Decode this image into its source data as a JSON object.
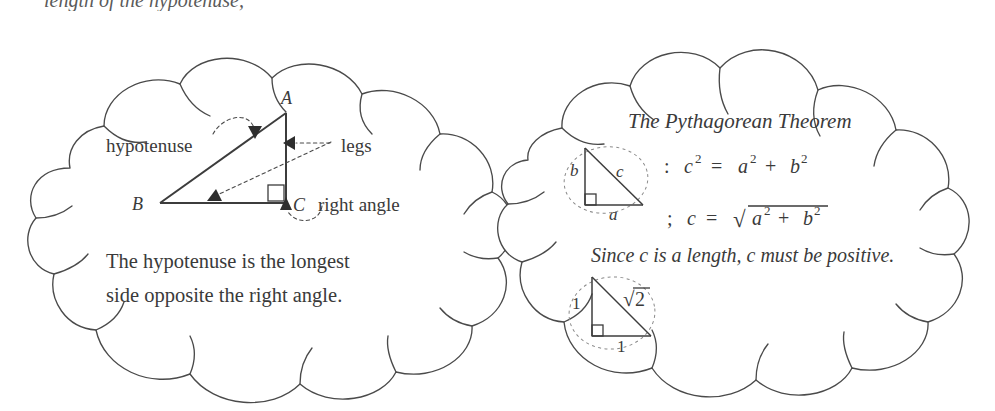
{
  "page": {
    "width": 995,
    "height": 411,
    "background": "#ffffff",
    "ink_color": "#3a3a3a",
    "outline_color": "#4a4a4a",
    "dash_color": "#8a8a8a"
  },
  "clipped_top_text": "length of the hypotenuse,",
  "left_cloud": {
    "name": "hypotenuse-cloud",
    "labels": {
      "hypotenuse": "hypotenuse",
      "legs": "legs",
      "right_angle": "right angle"
    },
    "triangle": {
      "vertices": [
        "A",
        "B",
        "C"
      ],
      "vertex_A": "A",
      "vertex_B": "B",
      "vertex_C": "C"
    },
    "caption_line1": "The hypotenuse is the longest",
    "caption_line2": "side opposite the right angle."
  },
  "right_cloud": {
    "name": "pythagorean-theorem-cloud",
    "title": "The Pythagorean Theorem",
    "triangle_labels": {
      "leg_vertical": "b",
      "hypotenuse": "c",
      "leg_horizontal": "a"
    },
    "formula1": {
      "prefix": ":",
      "lhs_base": "c",
      "lhs_exp": "2",
      "eq": "=",
      "t1_base": "a",
      "t1_exp": "2",
      "plus": "+",
      "t2_base": "b",
      "t2_exp": "2",
      "plain": ": c² = a² + b²"
    },
    "formula2": {
      "prefix": ";",
      "lhs": "c",
      "eq": "=",
      "radical": "√",
      "r1_base": "a",
      "r1_exp": "2",
      "plus": "+",
      "r2_base": "b",
      "r2_exp": "2",
      "plain": "; c = √(a² + b²)"
    },
    "note": "Since c is a length,  c must be positive.",
    "example_triangle_labels": {
      "leg_vertical": "1",
      "hypotenuse_radical": "√",
      "hypotenuse_value": "2",
      "leg_horizontal": "1"
    }
  },
  "icons": {
    "arrowhead": "triangle-arrowhead-icon",
    "right_angle_marker": "right-angle-square-icon",
    "dashed_ellipse": "dashed-ellipse-highlight-icon"
  }
}
